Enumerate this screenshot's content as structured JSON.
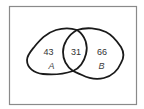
{
  "diagram": {
    "type": "venn",
    "sets": [
      {
        "name": "A",
        "label": "A",
        "only_count": "43"
      },
      {
        "name": "B",
        "label": "B",
        "only_count": "66"
      }
    ],
    "intersection": {
      "sets": [
        "A",
        "B"
      ],
      "count": "31"
    }
  },
  "colors": {
    "outline": "#1a1a1a",
    "frame": "#8a8a8a",
    "text": "#333333",
    "background": "#ffffff"
  }
}
